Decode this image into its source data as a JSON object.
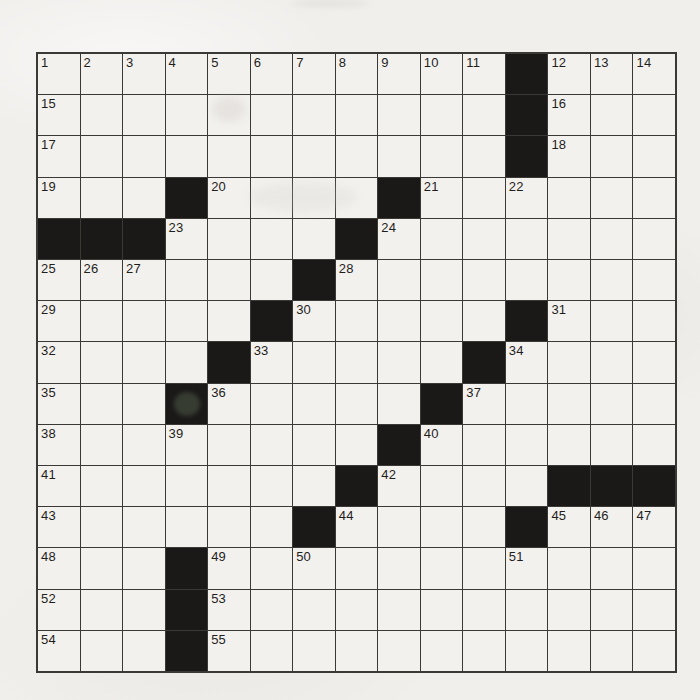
{
  "puzzle": {
    "kind": "crossword-grid",
    "rows": 15,
    "cols": 15,
    "visible_clue_numbers": [
      "1",
      "2",
      "3",
      "4",
      "5",
      "6",
      "7",
      "8",
      "9",
      "10",
      "11",
      "12",
      "13",
      "14",
      "15",
      "16",
      "17",
      "18",
      "19",
      "20",
      "21",
      "22",
      "23",
      "24",
      "25",
      "26",
      "27",
      "28",
      "29",
      "30",
      "31",
      "32",
      "33",
      "34",
      "35",
      "36",
      "37",
      "38",
      "39",
      "40",
      "41",
      "42",
      "43",
      "44",
      "45",
      "46",
      "47",
      "48",
      "49",
      "50",
      "51",
      "52",
      "53",
      "54",
      "55"
    ],
    "grid": [
      [
        "1",
        "2",
        "3",
        "4",
        "5",
        "6",
        "7",
        "8",
        "9",
        "10",
        "11",
        "#",
        "12",
        "13",
        "14"
      ],
      [
        "15",
        "",
        "",
        "",
        "",
        "",
        "",
        "",
        "",
        "",
        "",
        "#",
        "16",
        "",
        ""
      ],
      [
        "17",
        "",
        "",
        "",
        "",
        "",
        "",
        "",
        "",
        "",
        "",
        "#",
        "18",
        "",
        ""
      ],
      [
        "19",
        "",
        "",
        "#",
        "20",
        "",
        "",
        "",
        "#",
        "21",
        "",
        "22",
        "",
        "",
        ""
      ],
      [
        "#",
        "#",
        "#",
        "23",
        "",
        "",
        "",
        "#",
        "24",
        "",
        "",
        "",
        "",
        "",
        ""
      ],
      [
        "25",
        "26",
        "27",
        "",
        "",
        "",
        "#",
        "28",
        "",
        "",
        "",
        "",
        "",
        "",
        ""
      ],
      [
        "29",
        "",
        "",
        "",
        "",
        "#",
        "30",
        "",
        "",
        "",
        "",
        "#",
        "31",
        "",
        ""
      ],
      [
        "32",
        "",
        "",
        "",
        "#",
        "33",
        "",
        "",
        "",
        "",
        "#",
        "34",
        "",
        "",
        ""
      ],
      [
        "35",
        "",
        "",
        "#",
        "36",
        "",
        "",
        "",
        "",
        "#",
        "37",
        "",
        "",
        "",
        ""
      ],
      [
        "38",
        "",
        "",
        "39",
        "",
        "",
        "",
        "",
        "#",
        "40",
        "",
        "",
        "",
        "",
        ""
      ],
      [
        "41",
        "",
        "",
        "",
        "",
        "",
        "",
        "#",
        "42",
        "",
        "",
        "",
        "#",
        "#",
        "#"
      ],
      [
        "43",
        "",
        "",
        "",
        "",
        "",
        "#",
        "44",
        "",
        "",
        "",
        "#",
        "45",
        "46",
        "47"
      ],
      [
        "48",
        "",
        "",
        "#",
        "49",
        "",
        "50",
        "",
        "",
        "",
        "",
        "51",
        "",
        "",
        ""
      ],
      [
        "52",
        "",
        "",
        "#",
        "53",
        "",
        "",
        "",
        "",
        "",
        "",
        "",
        "",
        "",
        ""
      ],
      [
        "54",
        "",
        "",
        "#",
        "55",
        "",
        "",
        "",
        "",
        "",
        "",
        "",
        "",
        "",
        ""
      ]
    ],
    "colors": {
      "paper": "#f1efec",
      "cell": "#f3f1ee",
      "black_cell": "#1a1917",
      "grid_line": "#3b3936",
      "number_ink": "#1f1e1c"
    }
  }
}
